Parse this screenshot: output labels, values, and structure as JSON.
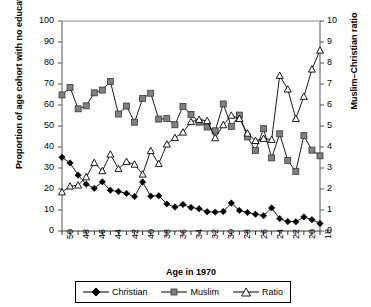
{
  "chart_data": {
    "type": "line",
    "title": "",
    "xlabel": "Age in 1970",
    "ylabel": "Proportion of age cohort with no education (%)",
    "y2label": "Muslim–Christian ratio",
    "xlim": [
      50,
      18
    ],
    "ylim": [
      0,
      100
    ],
    "y2lim": [
      0,
      10
    ],
    "grid": false,
    "legend_position": "bottom",
    "x": [
      50,
      49,
      48,
      47,
      46,
      45,
      44,
      43,
      42,
      41,
      40,
      39,
      38,
      37,
      36,
      35,
      34,
      33,
      32,
      31,
      30,
      29,
      28,
      27,
      26,
      25,
      24,
      23,
      22,
      21,
      20,
      19,
      18
    ],
    "x_tick_labels": [
      "50",
      "48",
      "46",
      "44",
      "42",
      "40",
      "38",
      "36",
      "34",
      "32",
      "30",
      "28",
      "26",
      "24",
      "22",
      "20",
      "18"
    ],
    "y_tick_labels": [
      "0",
      "10",
      "20",
      "30",
      "40",
      "50",
      "60",
      "70",
      "80",
      "90",
      "100"
    ],
    "y2_tick_labels": [
      "0",
      "1",
      "2",
      "3",
      "4",
      "5",
      "6",
      "7",
      "8",
      "9",
      "10"
    ],
    "series": [
      {
        "name": "Christian",
        "axis": "left",
        "marker": "filled-diamond",
        "color": "#000000",
        "values": [
          35.1,
          32.4,
          26.6,
          22.3,
          20.3,
          23.4,
          19.4,
          18.8,
          17.9,
          16.4,
          23.3,
          16.6,
          16.8,
          12.9,
          11.4,
          12.6,
          11.2,
          10.6,
          9.2,
          9.0,
          9.3,
          13.3,
          9.8,
          8.8,
          8.0,
          7.3,
          11.0,
          5.9,
          4.5,
          4.4,
          6.7,
          5.4,
          3.6
        ]
      },
      {
        "name": "Muslim",
        "axis": "left",
        "marker": "gray-square",
        "color": "#7f7f7f",
        "values": [
          64.8,
          68.4,
          58.2,
          59.6,
          65.8,
          67.1,
          71.2,
          55.7,
          59.5,
          51.8,
          63.1,
          65.6,
          53.3,
          53.5,
          50.6,
          59.3,
          55.5,
          51.8,
          49.5,
          47.7,
          60.5,
          49.8,
          55.2,
          44.8,
          38.3,
          48.7,
          34.8,
          46.3,
          33.6,
          28.4,
          45.4,
          38.5,
          35.8
        ]
      },
      {
        "name": "Ratio",
        "axis": "right",
        "marker": "open-triangle",
        "color": "#000000",
        "values": [
          1.85,
          2.13,
          2.18,
          2.57,
          3.25,
          2.86,
          3.65,
          2.96,
          3.3,
          3.17,
          2.7,
          3.82,
          3.2,
          4.13,
          4.44,
          4.7,
          5.2,
          5.3,
          5.25,
          4.43,
          5.05,
          5.5,
          5.35,
          4.65,
          4.3,
          4.4,
          4.35,
          7.4,
          6.75,
          5.35,
          6.4,
          7.7,
          8.6
        ]
      }
    ]
  },
  "legend": {
    "items": [
      {
        "label": "Christian",
        "marker": "filled-diamond"
      },
      {
        "label": "Muslim",
        "marker": "gray-square"
      },
      {
        "label": "Ratio",
        "marker": "open-triangle"
      }
    ]
  }
}
